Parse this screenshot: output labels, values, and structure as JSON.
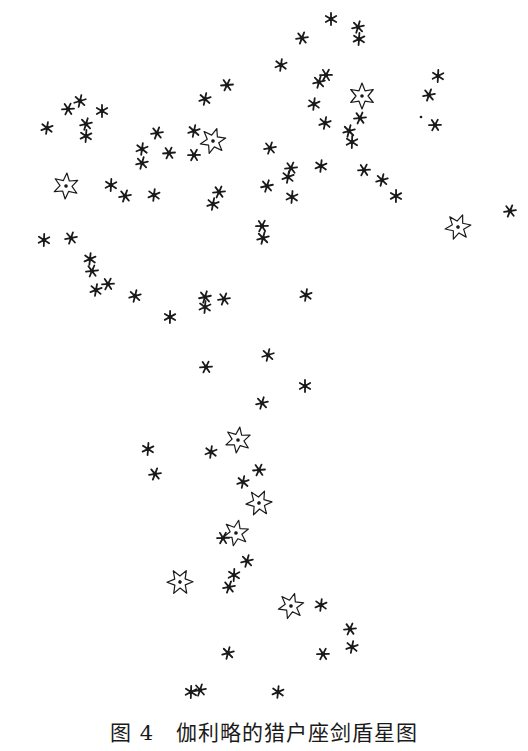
{
  "figure": {
    "caption_label": "图 4",
    "caption_text": "伽利略的猎户座剑盾星图",
    "ink_color": "#1a1a1a",
    "background": "#ffffff"
  },
  "stars": {
    "small": [
      [
        331,
        19
      ],
      [
        358,
        27
      ],
      [
        359,
        39
      ],
      [
        302,
        38
      ],
      [
        281,
        65
      ],
      [
        227,
        85
      ],
      [
        205,
        99
      ],
      [
        326,
        75
      ],
      [
        319,
        82
      ],
      [
        438,
        76
      ],
      [
        429,
        95
      ],
      [
        314,
        104
      ],
      [
        360,
        118
      ],
      [
        325,
        123
      ],
      [
        435,
        125
      ],
      [
        349,
        131
      ],
      [
        352,
        142
      ],
      [
        270,
        148
      ],
      [
        321,
        166
      ],
      [
        291,
        168
      ],
      [
        288,
        177
      ],
      [
        364,
        170
      ],
      [
        382,
        180
      ],
      [
        396,
        196
      ],
      [
        267,
        186
      ],
      [
        292,
        197
      ],
      [
        510,
        211
      ],
      [
        47,
        128
      ],
      [
        68,
        109
      ],
      [
        80,
        101
      ],
      [
        102,
        111
      ],
      [
        86,
        124
      ],
      [
        86,
        136
      ],
      [
        157,
        133
      ],
      [
        142,
        149
      ],
      [
        169,
        153
      ],
      [
        194,
        131
      ],
      [
        194,
        155
      ],
      [
        142,
        163
      ],
      [
        111,
        185
      ],
      [
        125,
        196
      ],
      [
        154,
        195
      ],
      [
        219,
        192
      ],
      [
        213,
        204
      ],
      [
        262,
        226
      ],
      [
        263,
        238
      ],
      [
        44,
        240
      ],
      [
        71,
        238
      ],
      [
        90,
        259
      ],
      [
        92,
        271
      ],
      [
        96,
        290
      ],
      [
        108,
        284
      ],
      [
        135,
        296
      ],
      [
        170,
        317
      ],
      [
        205,
        297
      ],
      [
        205,
        307
      ],
      [
        224,
        299
      ],
      [
        306,
        295
      ],
      [
        206,
        367
      ],
      [
        268,
        355
      ],
      [
        305,
        386
      ],
      [
        262,
        403
      ],
      [
        148,
        449
      ],
      [
        155,
        474
      ],
      [
        211,
        452
      ],
      [
        259,
        470
      ],
      [
        243,
        482
      ],
      [
        223,
        538
      ],
      [
        247,
        561
      ],
      [
        234,
        575
      ],
      [
        229,
        587
      ],
      [
        321,
        605
      ],
      [
        350,
        629
      ],
      [
        352,
        647
      ],
      [
        323,
        654
      ],
      [
        228,
        653
      ],
      [
        191,
        692
      ],
      [
        200,
        690
      ],
      [
        278,
        692
      ]
    ],
    "large": [
      [
        362,
        96
      ],
      [
        213,
        141
      ],
      [
        66,
        186
      ],
      [
        458,
        227
      ],
      [
        238,
        440
      ],
      [
        259,
        503
      ],
      [
        236,
        533
      ],
      [
        180,
        582
      ],
      [
        291,
        606
      ]
    ],
    "dots": [
      [
        421,
        117
      ]
    ]
  }
}
